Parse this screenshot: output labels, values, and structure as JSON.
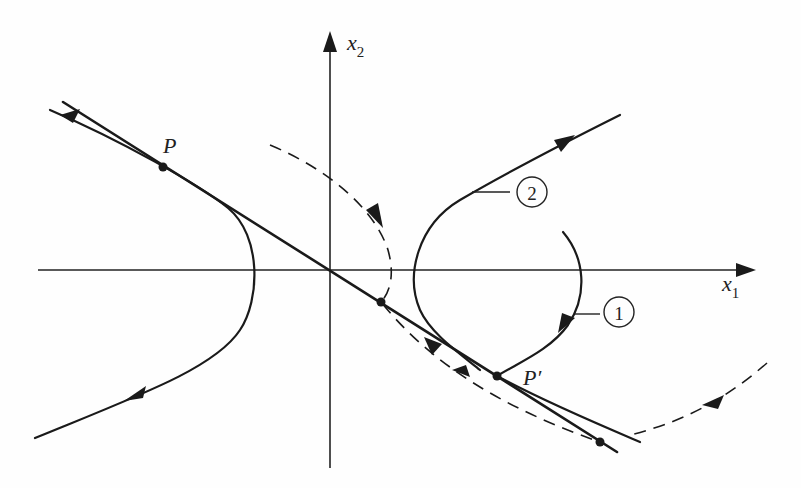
{
  "figure": {
    "type": "phase-portrait",
    "axes": {
      "x_label": "x",
      "x_subscript": "1",
      "y_label": "x",
      "y_subscript": "2"
    },
    "points": [
      {
        "id": "P",
        "label": "P"
      },
      {
        "id": "P_prime",
        "label": "P′"
      }
    ],
    "trajectory_labels": [
      {
        "id": "traj-1",
        "label": "1"
      },
      {
        "id": "traj-2",
        "label": "2"
      }
    ],
    "colors": {
      "ink": "#1a1a1a",
      "background": "#ffffff"
    }
  }
}
